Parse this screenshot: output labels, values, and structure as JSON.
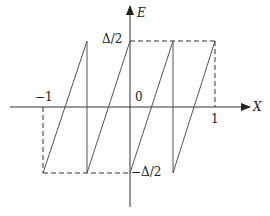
{
  "diagram": {
    "type": "sawtooth-function-plot",
    "axes": {
      "x_label": "X",
      "y_label": "E"
    },
    "tick_labels": {
      "x_neg_one": "−1",
      "x_zero": "0",
      "x_one": "1",
      "y_top": "Δ/2",
      "y_bottom": "−Δ/2"
    },
    "colors": {
      "line": "#555555",
      "axis": "#333333",
      "text": "#222222",
      "background": "#ffffff"
    },
    "teeth": 4,
    "x_range": [
      -1,
      1
    ],
    "y_range": [
      "-Δ/2",
      "Δ/2"
    ]
  }
}
